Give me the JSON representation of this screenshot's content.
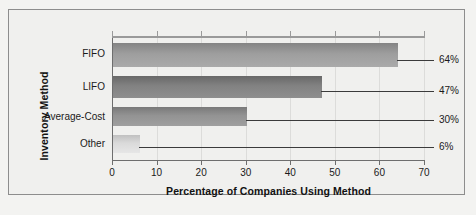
{
  "chart_data": {
    "type": "bar",
    "orientation": "horizontal",
    "title": "",
    "xlabel": "Percentage of Companies Using Method",
    "ylabel": "Inventory Method",
    "categories": [
      "FIFO",
      "LIFO",
      "Average-Cost",
      "Other"
    ],
    "values": [
      64,
      47,
      30,
      6
    ],
    "value_labels": [
      "64%",
      "47%",
      "30%",
      "6%"
    ],
    "xlim": [
      0,
      70
    ],
    "xticks": [
      0,
      10,
      20,
      30,
      40,
      50,
      60,
      70
    ],
    "xticklabels": [
      "0",
      "10",
      "20",
      "30",
      "40",
      "50",
      "60",
      "70"
    ],
    "grid": "vertical",
    "legend": "none",
    "bar_colors": [
      "#9a9a9a",
      "#7e7e7e",
      "#8f8f8f",
      "#d6d6d6"
    ],
    "frame_color": "#8d8d8d",
    "background": "#f0f0ee"
  },
  "axes": {
    "y_title": "Inventory Method",
    "x_title": "Percentage of Companies Using Method"
  }
}
